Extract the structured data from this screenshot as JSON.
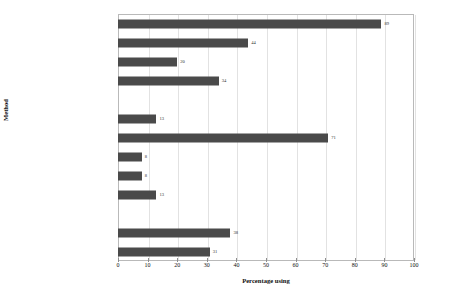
{
  "chart_data": {
    "type": "bar",
    "orientation": "horizontal",
    "title": "",
    "xlabel": "Percentage using",
    "ylabel": "Method",
    "xlim": [
      0,
      100
    ],
    "xticks": [
      0,
      10,
      20,
      30,
      40,
      50,
      60,
      70,
      80,
      90,
      100
    ],
    "grid": true,
    "legend": false,
    "bar_color": "#4a4a4a",
    "grid_color": "#e2e2e2",
    "frame_color": "#b9b9b9",
    "categories": [
      "Advert in local press",
      "Advert in national press",
      "Advert in journal",
      "Advert in shop/noticeboard",
      "",
      "Recruitment agency",
      "Jobcentre – display",
      "Jobcentre – staff",
      "Job Club",
      "Find self-employed work",
      "",
      "Friend or relative",
      "Contacted employer directly"
    ],
    "values": [
      89,
      44,
      20,
      34,
      null,
      13,
      71,
      8,
      8,
      13,
      null,
      38,
      31
    ],
    "value_labels": [
      "89",
      "44",
      "20",
      "34",
      "",
      "13",
      "71",
      "8",
      "8",
      "13",
      "",
      "38",
      "31"
    ]
  }
}
